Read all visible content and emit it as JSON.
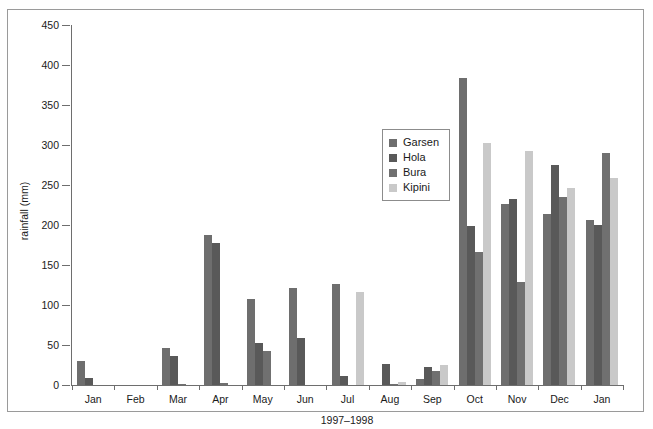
{
  "chart_data": {
    "type": "bar",
    "title": "",
    "xlabel": "1997–1998",
    "ylabel": "rainfall (mm)",
    "ylim": [
      0,
      450
    ],
    "ytick_step": 50,
    "yticks": [
      0,
      50,
      100,
      150,
      200,
      250,
      300,
      350,
      400,
      450
    ],
    "grid": false,
    "legend_position": "inside-upper-center",
    "categories": [
      "Jan",
      "Feb",
      "Mar",
      "Apr",
      "May",
      "Jun",
      "Jul",
      "Aug",
      "Sep",
      "Oct",
      "Nov",
      "Dec",
      "Jan"
    ],
    "series": [
      {
        "name": "Garsen",
        "color": "#6e6e6e",
        "values": [
          30,
          0,
          46,
          188,
          107,
          121,
          126,
          0,
          7,
          384,
          226,
          214,
          206
        ]
      },
      {
        "name": "Hola",
        "color": "#595959",
        "values": [
          9,
          0,
          36,
          177,
          52,
          59,
          11,
          26,
          23,
          199,
          232,
          275,
          200
        ]
      },
      {
        "name": "Bura",
        "color": "#707070",
        "values": [
          0,
          0,
          1,
          3,
          42,
          0,
          0,
          1,
          18,
          166,
          129,
          235,
          290
        ]
      },
      {
        "name": "Kipini",
        "color": "#c9c9c9",
        "values": [
          0,
          0,
          0,
          0,
          0,
          0,
          116,
          4,
          25,
          302,
          292,
          246,
          259
        ]
      }
    ]
  },
  "legend": {
    "items": [
      {
        "label": "Garsen",
        "color": "#6e6e6e"
      },
      {
        "label": "Hola",
        "color": "#595959"
      },
      {
        "label": "Bura",
        "color": "#707070"
      },
      {
        "label": "Kipini",
        "color": "#c9c9c9"
      }
    ]
  },
  "colors": {
    "axis": "#6e6e6e",
    "border": "#9a9a9a",
    "text": "#1a1a1a",
    "background": "#ffffff"
  }
}
